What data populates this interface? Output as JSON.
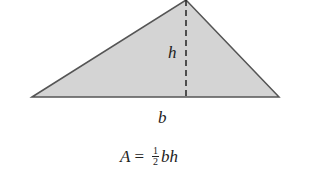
{
  "diagram": {
    "shape": "triangle",
    "fill_color": "#d4d4d4",
    "stroke_color": "#555555",
    "vertices": {
      "left": [
        32,
        97
      ],
      "apex": [
        186,
        0
      ],
      "right": [
        279,
        97
      ]
    },
    "height_line": {
      "x": 186,
      "y1": 0,
      "y2": 97,
      "style": "dashed"
    },
    "labels": {
      "height": "h",
      "base": "b"
    }
  },
  "formula": {
    "lhs": "A",
    "equals": "=",
    "frac_num": "1",
    "frac_den": "2",
    "rhs": "bh"
  }
}
